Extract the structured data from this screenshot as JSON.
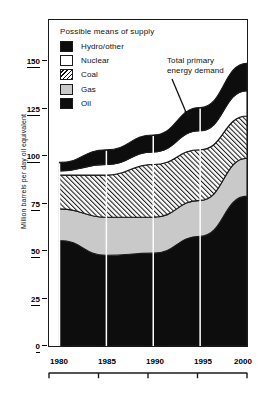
{
  "chart_data": {
    "type": "area",
    "title": "",
    "xlabel": "",
    "ylabel": "Million barrels per day oil equivalent",
    "x": [
      1980,
      1985,
      1990,
      1995,
      2000
    ],
    "xtick_labels": [
      "1980",
      "1985",
      "1990",
      "1995",
      "2000"
    ],
    "xlim": [
      1980,
      2000
    ],
    "ylim": [
      0,
      150
    ],
    "ytick_labels": [
      "0",
      "25",
      "50",
      "75",
      "100",
      "125",
      "150"
    ],
    "ytick_values": [
      0,
      25,
      50,
      75,
      100,
      125,
      150
    ],
    "grid": "vertical white separators at each 5-year mark",
    "legend_position": "inside top-left",
    "stacked": true,
    "series": [
      {
        "name": "Oil",
        "values": [
          50,
          43,
          44,
          52,
          71
        ],
        "color": "#0d0d0d",
        "pattern": "solid-black"
      },
      {
        "name": "Gas",
        "values": [
          15,
          18,
          17,
          17,
          18
        ],
        "color": "#c9c9c9",
        "pattern": "solid-grey"
      },
      {
        "name": "Coal",
        "values": [
          16,
          20,
          25,
          24,
          20
        ],
        "color": "#ffffff",
        "pattern": "diagonal-hatch"
      },
      {
        "name": "Nuclear",
        "values": [
          2,
          5,
          6,
          9,
          12
        ],
        "color": "#ffffff",
        "pattern": "solid-white"
      },
      {
        "name": "Hydro/other",
        "values": [
          4,
          7,
          8,
          11,
          13
        ],
        "color": "#0d0d0d",
        "pattern": "solid-black"
      }
    ],
    "totals": [
      87,
      93,
      100,
      113,
      134
    ],
    "annotations": [
      {
        "text": "Total primary energy demand",
        "target": "top of stacked area near 1995"
      }
    ]
  },
  "legend": {
    "title": "Possible means  of  supply",
    "items": [
      {
        "label": "Hydro/other",
        "swatch": "black"
      },
      {
        "label": "Nuclear",
        "swatch": "white"
      },
      {
        "label": "Coal",
        "swatch": "hatch"
      },
      {
        "label": "Gas",
        "swatch": "grey"
      },
      {
        "label": "Oil",
        "swatch": "black"
      }
    ]
  },
  "annotation": {
    "line1": "Total primary",
    "line2": "energy demand"
  },
  "axes": {
    "y_title": "Million barrels per day oil equivalent",
    "y_ticks": [
      "150",
      "125",
      "100",
      "75",
      "50",
      "25",
      "0"
    ],
    "x_ticks": [
      "1980",
      "1985",
      "1990",
      "1995",
      "2000"
    ]
  }
}
